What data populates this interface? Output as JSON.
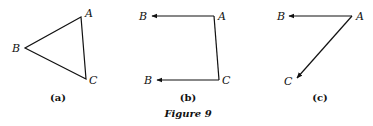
{
  "figure": {
    "caption": "Figure 9",
    "colors": {
      "ink": "#111111",
      "background": "#ffffff"
    },
    "panels": [
      {
        "id": "a",
        "label": "(a)",
        "type": "triangle",
        "points": {
          "A": "A",
          "B": "B",
          "C": "C"
        },
        "edges": [
          "A-B",
          "B-C",
          "C-A"
        ],
        "arrows": false
      },
      {
        "id": "b",
        "label": "(b)",
        "type": "vector-path",
        "points": {
          "A": "A",
          "B_top": "B",
          "C": "C",
          "B_bottom": "B"
        },
        "edges": [
          "A→B (arrow)",
          "A-C",
          "C→B (arrow)"
        ],
        "arrows": true
      },
      {
        "id": "c",
        "label": "(c)",
        "type": "vectors-from-point",
        "points": {
          "A": "A",
          "B": "B",
          "C": "C"
        },
        "edges": [
          "A→B (arrow)",
          "A→C (arrow)"
        ],
        "arrows": true
      }
    ]
  }
}
